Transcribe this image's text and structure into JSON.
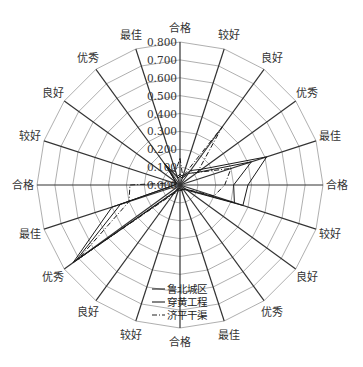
{
  "chart_data": {
    "type": "radar",
    "title": "",
    "axes": [
      "合格",
      "较好",
      "良好",
      "优秀",
      "最佳",
      "合格",
      "较好",
      "良好",
      "优秀",
      "最佳",
      "合格",
      "较好",
      "良好",
      "优秀",
      "最佳",
      "合格",
      "较好",
      "良好",
      "优秀",
      "最佳"
    ],
    "radial_ticks": [
      "0.000",
      "0.100",
      "0.200",
      "0.300",
      "0.400",
      "0.500",
      "0.600",
      "0.700",
      "0.800"
    ],
    "rlim": [
      0,
      0.8
    ],
    "grid": true,
    "legend_position": "bottom-center",
    "series": [
      {
        "name": "鲁北城区",
        "style": "solid",
        "values": [
          0.06,
          0.05,
          0.1,
          0.15,
          0.51,
          0.38,
          0.37,
          0.05,
          0.03,
          0.03,
          0.03,
          0.03,
          0.05,
          0.74,
          0.4,
          0.03,
          0.03,
          0.03,
          0.15,
          0.05
        ]
      },
      {
        "name": "穿黄工程",
        "style": "solid",
        "values": [
          0.05,
          0.04,
          0.08,
          0.12,
          0.42,
          0.3,
          0.32,
          0.04,
          0.03,
          0.03,
          0.02,
          0.02,
          0.04,
          0.72,
          0.35,
          0.03,
          0.02,
          0.03,
          0.12,
          0.04
        ]
      },
      {
        "name": "济平干渠",
        "style": "dash-dot",
        "values": [
          0.15,
          0.05,
          0.4,
          0.12,
          0.3,
          0.25,
          0.2,
          0.04,
          0.03,
          0.03,
          0.03,
          0.04,
          0.06,
          0.7,
          0.3,
          0.28,
          0.04,
          0.03,
          0.1,
          0.08
        ]
      }
    ]
  },
  "legend": {
    "items": [
      "鲁北城区",
      "穿黄工程",
      "济平干渠"
    ]
  }
}
